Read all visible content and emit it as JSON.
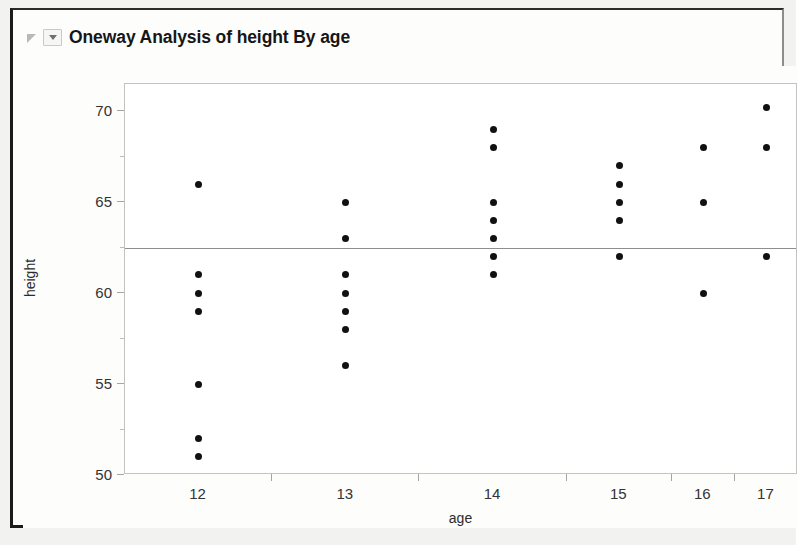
{
  "window": {
    "title": "Oneway Analysis of height By age",
    "disclosure_icon": "disclosure-triangle-icon",
    "popup_icon": "popup-caret-icon"
  },
  "chart_data": {
    "type": "scatter",
    "title": "Oneway Analysis of height By age",
    "xlabel": "age",
    "ylabel": "height",
    "x_categories": [
      "12",
      "13",
      "14",
      "15",
      "16",
      "17"
    ],
    "y_ticks": [
      50,
      55,
      60,
      65,
      70
    ],
    "y_minor_ticks": [
      52.5,
      57.5,
      62.5,
      67.5
    ],
    "ylim": [
      50,
      71.5
    ],
    "grid": false,
    "legend": null,
    "grand_mean": 62.5,
    "grand_mean_line_color": "#8e8e8e",
    "point_color": "#111111",
    "groups": [
      {
        "category": "12",
        "n": 7,
        "values": [
          66,
          61,
          60,
          59,
          55,
          52,
          51
        ]
      },
      {
        "category": "13",
        "n": 7,
        "values": [
          65,
          63,
          61,
          60,
          59,
          58,
          56
        ]
      },
      {
        "category": "14",
        "n": 7,
        "values": [
          69,
          68,
          65,
          64,
          63,
          62,
          61
        ]
      },
      {
        "category": "15",
        "n": 5,
        "values": [
          67,
          66,
          65,
          64,
          62
        ]
      },
      {
        "category": "16",
        "n": 3,
        "values": [
          68,
          65,
          60
        ]
      },
      {
        "category": "17",
        "n": 3,
        "values": [
          70.2,
          68,
          62
        ]
      }
    ]
  }
}
